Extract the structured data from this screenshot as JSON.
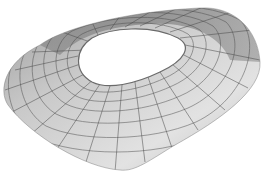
{
  "image": {
    "description": "3D wireframe rendering of an oval stadium roof shell with a central opening",
    "subject": "stadium-roof-wireframe",
    "colors": {
      "background": "#ffffff",
      "shell_light": "#e6e6e6",
      "shell_mid": "#c4c4c4",
      "shell_dark": "#9a9a9a",
      "grid_line": "#4a4a4a"
    }
  }
}
